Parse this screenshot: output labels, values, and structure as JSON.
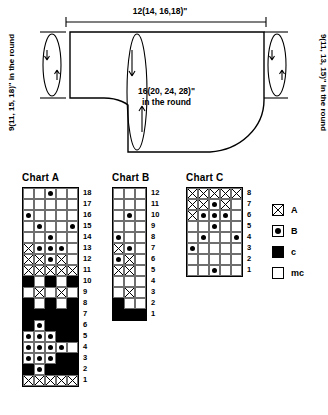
{
  "schematic": {
    "name": "garment-schematic",
    "top_dimension": "12(14, 16,18)\"",
    "left_dimension": "9(11, 15, 18)\" in the round",
    "right_dimension": "9(11, 13, 15)\" in the round",
    "center_label_line1": "16(20, 24, 28)\"",
    "center_label_line2": "in the round"
  },
  "legend": {
    "title": "",
    "items": [
      {
        "symbol": "a",
        "label": "A"
      },
      {
        "symbol": "b",
        "label": "B"
      },
      {
        "symbol": "c",
        "label": "c"
      },
      {
        "symbol": "mc",
        "label": "mc"
      }
    ]
  },
  "charts": [
    {
      "title": "Chart A",
      "columns": 5,
      "rows": 18,
      "row_labels": [
        "18",
        "17",
        "16",
        "15",
        "14",
        "13",
        "12",
        "11",
        "10",
        "9",
        "8",
        "7",
        "6",
        "5",
        "4",
        "3",
        "2",
        "1"
      ],
      "cells": [
        [
          "mc",
          "mc",
          "b",
          "mc",
          "mc"
        ],
        [
          "mc",
          "mc",
          "mc",
          "mc",
          "mc"
        ],
        [
          "b",
          "mc",
          "mc",
          "mc",
          "mc"
        ],
        [
          "mc",
          "b",
          "mc",
          "mc",
          "b"
        ],
        [
          "mc",
          "mc",
          "b",
          "mc",
          "mc"
        ],
        [
          "a",
          "b",
          "b",
          "b",
          "mc"
        ],
        [
          "a",
          "a",
          "b",
          "a",
          "mc"
        ],
        [
          "a",
          "a",
          "a",
          "a",
          "a"
        ],
        [
          "c",
          "mc",
          "c",
          "mc",
          "c"
        ],
        [
          "mc",
          "a",
          "mc",
          "a",
          "mc"
        ],
        [
          "c",
          "mc",
          "c",
          "mc",
          "c"
        ],
        [
          "c",
          "c",
          "c",
          "c",
          "c"
        ],
        [
          "c",
          "b",
          "c",
          "c",
          "c"
        ],
        [
          "b",
          "b",
          "b",
          "c",
          "c"
        ],
        [
          "b",
          "b",
          "b",
          "b",
          "mc"
        ],
        [
          "b",
          "b",
          "b",
          "c",
          "c"
        ],
        [
          "c",
          "b",
          "c",
          "c",
          "c"
        ],
        [
          "a",
          "a",
          "a",
          "a",
          "a"
        ]
      ]
    },
    {
      "title": "Chart B",
      "columns": 3,
      "rows": 12,
      "row_labels": [
        "12",
        "11",
        "10",
        "9",
        "8",
        "7",
        "6",
        "5",
        "4",
        "3",
        "2",
        "1"
      ],
      "cells": [
        [
          "mc",
          "mc",
          "mc"
        ],
        [
          "mc",
          "mc",
          "mc"
        ],
        [
          "mc",
          "b",
          "mc"
        ],
        [
          "mc",
          "mc",
          "mc"
        ],
        [
          "b",
          "mc",
          "mc"
        ],
        [
          "a",
          "b",
          "mc"
        ],
        [
          "b",
          "a",
          "mc"
        ],
        [
          "a",
          "a",
          "mc"
        ],
        [
          "mc",
          "mc",
          "mc"
        ],
        [
          "mc",
          "a",
          "mc"
        ],
        [
          "c",
          "mc",
          "mc"
        ],
        [
          "c",
          "c",
          "c"
        ]
      ]
    },
    {
      "title": "Chart C",
      "columns": 5,
      "rows": 8,
      "row_labels": [
        "8",
        "7",
        "6",
        "5",
        "4",
        "3",
        "2",
        "1"
      ],
      "cells": [
        [
          "a",
          "a",
          "a",
          "a",
          "a"
        ],
        [
          "a",
          "a",
          "b",
          "a",
          "mc"
        ],
        [
          "a",
          "b",
          "b",
          "b",
          "mc"
        ],
        [
          "mc",
          "mc",
          "b",
          "mc",
          "mc"
        ],
        [
          "mc",
          "b",
          "mc",
          "mc",
          "b"
        ],
        [
          "b",
          "mc",
          "mc",
          "mc",
          "mc"
        ],
        [
          "mc",
          "mc",
          "mc",
          "mc",
          "mc"
        ],
        [
          "mc",
          "mc",
          "b",
          "mc",
          "mc"
        ]
      ]
    }
  ]
}
